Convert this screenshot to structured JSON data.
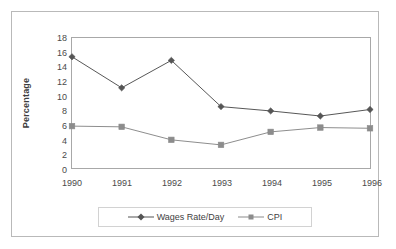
{
  "chart_data": {
    "type": "line",
    "title": "",
    "xlabel": "",
    "ylabel": "Percentage",
    "categories": [
      "1990",
      "1991",
      "1992",
      "1993",
      "1994",
      "1995",
      "1996"
    ],
    "x": [
      1990,
      1991,
      1992,
      1993,
      1994,
      1995,
      1996
    ],
    "ylim": [
      0,
      18
    ],
    "ytick_step": 2,
    "yticks": [
      "18",
      "16",
      "14",
      "12",
      "10",
      "8",
      "6",
      "4",
      "2",
      "0"
    ],
    "ytick_values": [
      18,
      16,
      14,
      12,
      10,
      8,
      6,
      4,
      2,
      0
    ],
    "grid": false,
    "legend_position": "bottom",
    "series": [
      {
        "name": "Wages Rate/Day",
        "marker": "diamond",
        "color": "#555555",
        "values": [
          15.4,
          11.1,
          14.9,
          8.5,
          7.9,
          7.2,
          8.1
        ]
      },
      {
        "name": "CPI",
        "marker": "square",
        "color": "#8c8c8c",
        "values": [
          5.8,
          5.7,
          3.9,
          3.2,
          5.0,
          5.6,
          5.5
        ]
      }
    ]
  },
  "legend": {
    "entries": [
      {
        "label": "Wages Rate/Day"
      },
      {
        "label": "CPI"
      }
    ]
  },
  "colors": {
    "series_wages": "#555555",
    "series_cpi": "#8c8c8c",
    "axis": "#a8a8a8",
    "frame": "#b9b9b9",
    "text": "#4a4a4a",
    "background": "#ffffff"
  }
}
